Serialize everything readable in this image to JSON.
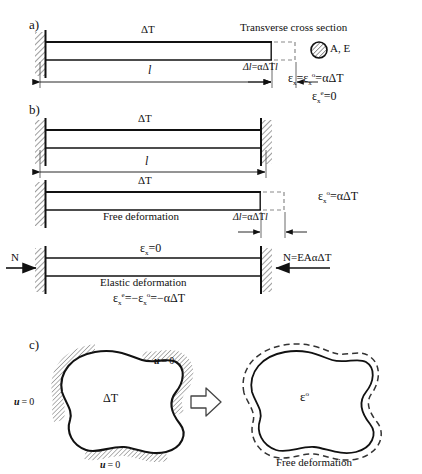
{
  "figure": {
    "sections": [
      {
        "key": "a",
        "label": "a)"
      },
      {
        "key": "b",
        "label": "b)"
      },
      {
        "key": "c",
        "label": "c)"
      }
    ]
  },
  "panel_a": {
    "section_label": "a)",
    "beam_temp_label": "ΔT",
    "length_label": "l",
    "elongation_label": "Δl = αΔTl",
    "cross_section_title": "Transverse cross section",
    "cross_section_props": "A, E",
    "equation_1_prefix": "ε",
    "equation_1": "εx = εxᵒ = αΔT",
    "equation_2": "εxᵉ = 0",
    "eq1_parts": {
      "s1": "ε",
      "sub1": "x",
      "mid": "=",
      "s2": "ε",
      "sub2": "x",
      "sup2": "o",
      "eq": "=",
      "rhs": "αΔT"
    },
    "eq2_parts": {
      "s": "ε",
      "sub": "x",
      "sup": "e",
      "eq": "= 0"
    }
  },
  "panel_b": {
    "section_label": "b)",
    "beam1_temp_label": "ΔT",
    "beam1_length_label": "l",
    "beam2_temp_label": "ΔT",
    "beam2_caption": "Free deformation",
    "beam2_elongation_label": "Δl = αΔTl",
    "beam2_equation": "εxᵒ = αΔT",
    "beam2_eq_parts": {
      "s": "ε",
      "sub": "x",
      "sup": "o",
      "rhs": "= αΔT"
    },
    "beam3_strain_label": "εx = 0",
    "beam3_strain_parts": {
      "s": "ε",
      "sub": "x",
      "rhs": "= 0"
    },
    "beam3_caption": "Elastic deformation",
    "beam3_force_left": "N",
    "beam3_force_right": "N = EAαΔT",
    "beam3_equation": "εxᵉ = −εxᵒ = −αΔT",
    "beam3_eq_parts": {
      "s1": "ε",
      "sub1": "x",
      "sup1": "e",
      "mid": "= −",
      "s2": "ε",
      "sub2": "x",
      "sup2": "o",
      "rhs": "= −αΔT"
    }
  },
  "panel_c": {
    "section_label": "c)",
    "body_temp_label": "ΔT",
    "bc_top_right": "u = 0",
    "bc_left": "u = 0",
    "bc_bottom": "u = 0",
    "bc_symbol": "u",
    "bc_value": "= 0",
    "arrow_name": "implies-arrow",
    "result_strain_label": "εᵒ",
    "result_strain_parts": {
      "s": "ε",
      "sup": "o"
    },
    "result_caption": "Free deformation"
  },
  "colors": {
    "ink": "#111111",
    "line": "#1a1a1a",
    "hatch": "#555555",
    "dashed": "#777777",
    "background": "#ffffff"
  }
}
